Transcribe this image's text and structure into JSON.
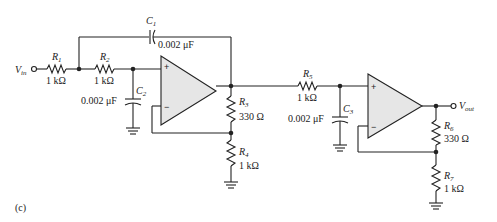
{
  "figure_label": "(c)",
  "input": {
    "label": "V",
    "sub": "in"
  },
  "output": {
    "label": "V",
    "sub": "out"
  },
  "components": {
    "R1": {
      "name": "R",
      "sub": "1",
      "value": "1 kΩ"
    },
    "R2": {
      "name": "R",
      "sub": "2",
      "value": "1 kΩ"
    },
    "R3": {
      "name": "R",
      "sub": "3",
      "value": "330 Ω"
    },
    "R4": {
      "name": "R",
      "sub": "4",
      "value": "1 kΩ"
    },
    "R5": {
      "name": "R",
      "sub": "5",
      "value": "1 kΩ"
    },
    "R6": {
      "name": "R",
      "sub": "6",
      "value": "330 Ω"
    },
    "R7": {
      "name": "R",
      "sub": "7",
      "value": "1 kΩ"
    },
    "C1": {
      "name": "C",
      "sub": "1",
      "value": "0.002 μF"
    },
    "C2": {
      "name": "C",
      "sub": "2",
      "value": "0.002 μF"
    },
    "C3": {
      "name": "C",
      "sub": "3",
      "value": "0.002 μF"
    }
  },
  "opamp_symbols": {
    "plus": "+",
    "minus": "−"
  },
  "colors": {
    "wire": "#222222",
    "opamp_fill": "#e6e6e6"
  }
}
